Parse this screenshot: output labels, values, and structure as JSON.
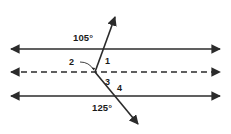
{
  "figure": {
    "kind": "geometry-angle-diagram",
    "background_color": "#ffffff",
    "stroke_color": "#2b2b2b",
    "text_color": "#1a1a1a",
    "width": 231,
    "height": 134,
    "lines": [
      {
        "name": "top-parallel-line",
        "style": "solid",
        "arrows": "both",
        "y": 49,
        "x1": 8,
        "x2": 223
      },
      {
        "name": "middle-dashed-line",
        "style": "dashed",
        "arrows": "both",
        "y": 72,
        "x1": 8,
        "x2": 223
      },
      {
        "name": "bottom-parallel-line",
        "style": "solid",
        "arrows": "both",
        "y": 96,
        "x1": 8,
        "x2": 223
      }
    ],
    "transversal": {
      "name": "bent-transversal",
      "arrows": "both",
      "upper_tip": {
        "x": 113,
        "y": 14
      },
      "vertex": {
        "x": 95,
        "y": 72
      },
      "lower_tip": {
        "x": 140,
        "y": 127
      },
      "crosses_top_line_at": {
        "x": 103,
        "y": 49
      },
      "crosses_bottom_line_at": {
        "x": 117,
        "y": 96
      }
    },
    "leader": {
      "name": "angle-2-leader-arc",
      "from": {
        "x": 80,
        "y": 62
      },
      "to": {
        "x": 94,
        "y": 70
      }
    },
    "labels": {
      "angle_top_measure": "105°",
      "angle_bottom_measure": "125°",
      "angle_1": "1",
      "angle_2": "2",
      "angle_3": "3",
      "angle_4": "4"
    }
  }
}
